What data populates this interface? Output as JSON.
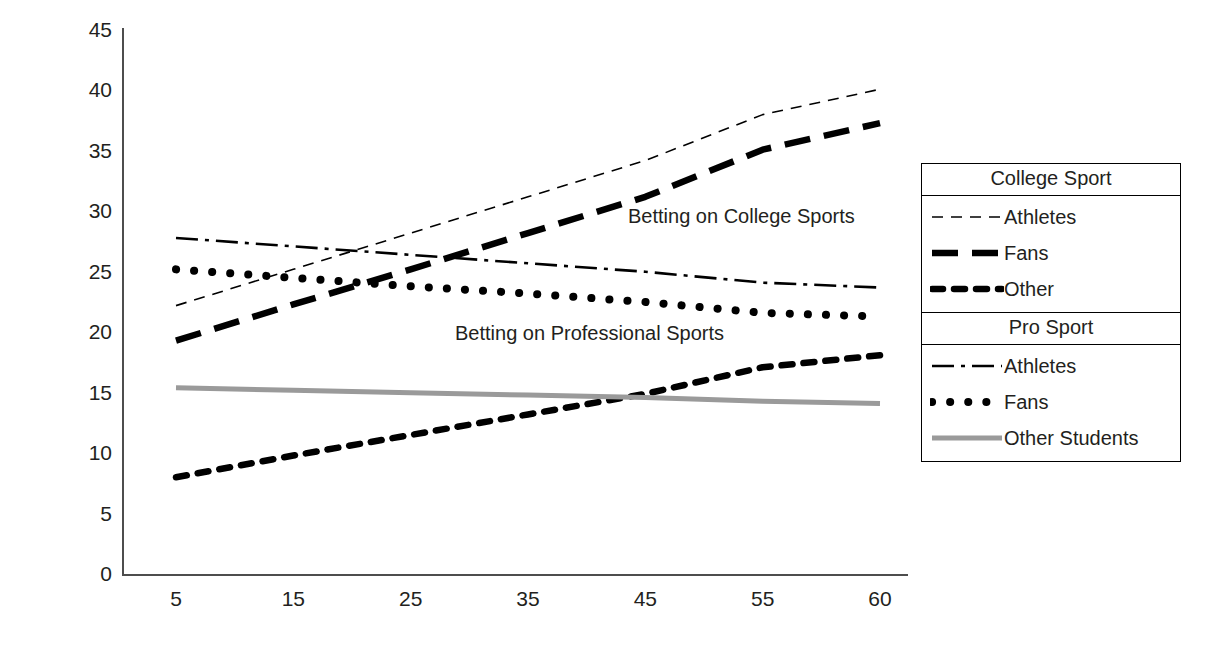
{
  "chart_data": {
    "type": "line",
    "title": "",
    "xlabel": "",
    "ylabel": "Predicted Prevalence of Gambling",
    "categories": [
      "5",
      "15",
      "25",
      "35",
      "45",
      "55",
      "60"
    ],
    "x_tick_labels": [
      "5",
      "15",
      "25",
      "35",
      "45",
      "55",
      "60"
    ],
    "y_tick_labels": [
      "0",
      "5",
      "10",
      "15",
      "20",
      "25",
      "30",
      "35",
      "40",
      "45"
    ],
    "ylim": [
      0,
      45
    ],
    "y_tick_step": 5,
    "grid": false,
    "legend_position": "right",
    "series": [
      {
        "name": "College Sport - Athletes",
        "group": "College Sport",
        "label": "Athletes",
        "style": "thin-dashed",
        "color": "#000000",
        "values": [
          22.2,
          25.2,
          28.2,
          31.2,
          34.2,
          38.0,
          40.1
        ]
      },
      {
        "name": "College Sport - Fans",
        "group": "College Sport",
        "label": "Fans",
        "style": "bold-dashed",
        "color": "#000000",
        "values": [
          19.3,
          22.3,
          25.2,
          28.2,
          31.2,
          35.1,
          37.3
        ]
      },
      {
        "name": "College Sport - Other",
        "group": "College Sport",
        "label": "Other",
        "style": "bold-dotted",
        "color": "#000000",
        "values": [
          8.0,
          9.8,
          11.5,
          13.2,
          14.9,
          17.1,
          18.1
        ]
      },
      {
        "name": "Pro Sport - Athletes",
        "group": "Pro Sport",
        "label": "Athletes",
        "style": "dash-dot",
        "color": "#000000",
        "values": [
          27.8,
          27.1,
          26.4,
          25.7,
          25.0,
          24.1,
          23.7
        ]
      },
      {
        "name": "Pro Sport - Fans",
        "group": "Pro Sport",
        "label": "Fans",
        "style": "round-dotted",
        "color": "#000000",
        "values": [
          25.2,
          24.5,
          23.8,
          23.2,
          22.5,
          21.6,
          21.3
        ]
      },
      {
        "name": "Pro Sport - Other Students",
        "group": "Pro Sport",
        "label": "Other Students",
        "style": "gray-solid",
        "color": "#9a9a9a",
        "values": [
          15.4,
          15.2,
          15.0,
          14.8,
          14.6,
          14.3,
          14.1
        ]
      }
    ],
    "annotations": [
      {
        "text": "Betting on College Sports",
        "x_category": "45",
        "y_value": 29.5
      },
      {
        "text": "Betting on Professional Sports",
        "x_category": "25",
        "y_value": 19.8
      }
    ]
  },
  "legend": {
    "groups": [
      {
        "header": "College Sport",
        "items": [
          {
            "label": "Athletes",
            "style": "thin-dashed"
          },
          {
            "label": "Fans",
            "style": "bold-dashed"
          },
          {
            "label": "Other",
            "style": "bold-dotted"
          }
        ]
      },
      {
        "header": "Pro Sport",
        "items": [
          {
            "label": "Athletes",
            "style": "dash-dot"
          },
          {
            "label": "Fans",
            "style": "round-dotted"
          },
          {
            "label": "Other Students",
            "style": "gray-solid"
          }
        ]
      }
    ]
  },
  "colors": {
    "axis": "#4d4d4d",
    "text": "#231f20",
    "series_black": "#000000",
    "series_gray": "#9a9a9a",
    "background": "#ffffff"
  }
}
